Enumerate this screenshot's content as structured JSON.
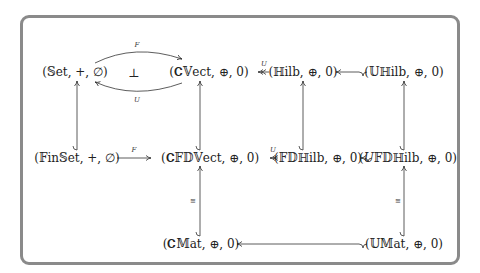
{
  "diagram": {
    "nodes": {
      "set": "(𝕊et, +, ∅)",
      "cvect": "(𝐂𝕍ect, ⊕, 0)",
      "hilb": "(ℍilb, ⊕, 0)",
      "uhilb": "(𝕌ℍilb, ⊕, 0)",
      "finset": "(𝔽in𝕊et, +, ∅)",
      "cfdvect": "(𝐂𝔽𝔻𝕍ect, ⊕, 0)",
      "fdhilb": "(𝔽𝔻ℍilb, ⊕, 0)",
      "ufdhilb": "(𝑈𝔽𝔻ℍilb, ⊕, 0)",
      "cmat": "(𝐂𝕄at, ⊕, 0)",
      "umat": "(𝕌𝕄at, ⊕, 0)"
    },
    "labels": {
      "F_top": "F",
      "U_bottom": "U",
      "adjoint": "⊥",
      "U_top_right": "U",
      "F_mid": "F",
      "U_mid": "U",
      "iso_left": "≅",
      "iso_right": "≅"
    },
    "edges": [
      {
        "from": "set",
        "to": "cvect",
        "label": "F",
        "type": "curved-arrow"
      },
      {
        "from": "cvect",
        "to": "set",
        "label": "U",
        "type": "curved-arrow"
      },
      {
        "from": "hilb",
        "to": "cvect",
        "label": "U",
        "type": "two-head-arrow"
      },
      {
        "from": "uhilb",
        "to": "hilb",
        "label": "",
        "type": "hook-arrow"
      },
      {
        "from": "finset",
        "to": "set",
        "label": "",
        "type": "hook-arrow"
      },
      {
        "from": "cfdvect",
        "to": "cvect",
        "label": "",
        "type": "hook-arrow"
      },
      {
        "from": "fdhilb",
        "to": "hilb",
        "label": "",
        "type": "hook-arrow"
      },
      {
        "from": "ufdhilb",
        "to": "uhilb",
        "label": "",
        "type": "hook-arrow"
      },
      {
        "from": "finset",
        "to": "cfdvect",
        "label": "F",
        "type": "arrow"
      },
      {
        "from": "fdhilb",
        "to": "cfdvect",
        "label": "U",
        "type": "two-head-arrow"
      },
      {
        "from": "ufdhilb",
        "to": "fdhilb",
        "label": "",
        "type": "hook-arrow"
      },
      {
        "from": "cmat",
        "to": "cfdvect",
        "label": "≅",
        "type": "hook-arrow"
      },
      {
        "from": "umat",
        "to": "ufdhilb",
        "label": "≅",
        "type": "hook-arrow"
      },
      {
        "from": "umat",
        "to": "cmat",
        "label": "",
        "type": "hook-arrow"
      }
    ]
  }
}
